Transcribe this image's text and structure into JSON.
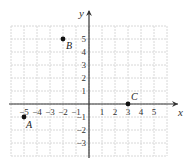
{
  "chart_data": {
    "type": "scatter",
    "title": "",
    "xlabel": "x",
    "ylabel": "y",
    "xlim": [
      -6,
      6
    ],
    "ylim": [
      -4,
      6
    ],
    "grid": true,
    "x_ticks": [
      -5,
      -4,
      -3,
      -2,
      -1,
      1,
      2,
      3,
      4,
      5
    ],
    "y_ticks": [
      -3,
      -2,
      -1,
      1,
      2,
      3,
      4,
      5
    ],
    "x_tick_labels": [
      "−5",
      "−4",
      "−3",
      "−2",
      "−1",
      "1",
      "2",
      "3",
      "4",
      "5"
    ],
    "y_tick_labels": [
      "−3",
      "−2",
      "−1",
      "1",
      "2",
      "3",
      "4",
      "5"
    ],
    "points": [
      {
        "label": "A",
        "x": -5,
        "y": -1
      },
      {
        "label": "B",
        "x": -2,
        "y": 5
      },
      {
        "label": "C",
        "x": 3,
        "y": 0
      }
    ]
  },
  "colors": {
    "grid": "#d8d8d8",
    "axis": "#333333",
    "point": "#111111"
  }
}
